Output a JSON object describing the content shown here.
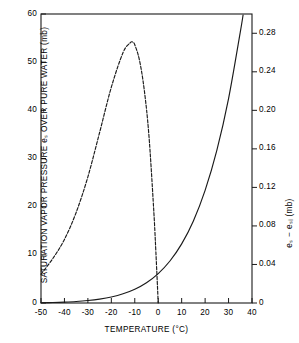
{
  "figure": {
    "background_color": "#ffffff",
    "line_color": "#1a1a1a",
    "frame_color": "#1a1a1a"
  },
  "chart_data": {
    "type": "line",
    "title": "",
    "subtitle": "",
    "xlabel": "TEMPERATURE (°C)",
    "ylabel": "SATURATION VAPOR PRESSURE eₛ OVER PURE WATER (mb)",
    "ylabel_right": "eₛ − eₛᵢ (mb)",
    "grid": false,
    "legend": "none",
    "xlim": [
      -50,
      40
    ],
    "ylim": [
      0,
      60
    ],
    "ylim_right": [
      0,
      0.3
    ],
    "xticks": [
      -50,
      -40,
      -30,
      -20,
      -10,
      0,
      10,
      20,
      30,
      40
    ],
    "xtick_labels": [
      "-50",
      "-40",
      "-30",
      "-20",
      "-10",
      "0",
      "10",
      "20",
      "30",
      "40"
    ],
    "yticks": [
      0,
      10,
      20,
      30,
      40,
      50,
      60
    ],
    "ytick_labels": [
      "0",
      "10",
      "20",
      "30",
      "40",
      "50",
      "60"
    ],
    "yticks_right": [
      0,
      0.04,
      0.08,
      0.12,
      0.16,
      0.2,
      0.24,
      0.28
    ],
    "ytick_labels_right": [
      "0",
      "0.04",
      "0.08",
      "0.12",
      "0.16",
      "0.20",
      "0.24",
      "0.28"
    ],
    "series": [
      {
        "name": "saturation vapor pressure over pure water",
        "style": "solid",
        "axis": "left",
        "x": [
          -50,
          -45,
          -40,
          -35,
          -30,
          -25,
          -20,
          -15,
          -10,
          -5,
          0,
          5,
          10,
          15,
          20,
          25,
          30,
          35,
          36.2
        ],
        "y": [
          0.06,
          0.11,
          0.19,
          0.31,
          0.51,
          0.81,
          1.25,
          1.91,
          2.86,
          4.21,
          6.11,
          8.72,
          12.27,
          17.04,
          23.37,
          31.67,
          42.43,
          56.24,
          59.8
        ]
      },
      {
        "name": "difference es minus esi (water minus ice)",
        "style": "dashed",
        "axis": "right",
        "x": [
          -50,
          -45,
          -40,
          -35,
          -30,
          -25,
          -20,
          -15,
          -12,
          -11,
          -10,
          -8,
          -6,
          -4,
          -2,
          -1,
          0
        ],
        "y": [
          0.03,
          0.046,
          0.066,
          0.094,
          0.131,
          0.177,
          0.224,
          0.26,
          0.27,
          0.271,
          0.268,
          0.252,
          0.222,
          0.175,
          0.1,
          0.053,
          0.0
        ]
      }
    ],
    "annotations": [
      {
        "text": "peak of difference curve near -11 °C at 0.27 mb"
      },
      {
        "text": "difference curve reaches zero at 0 °C"
      }
    ]
  }
}
